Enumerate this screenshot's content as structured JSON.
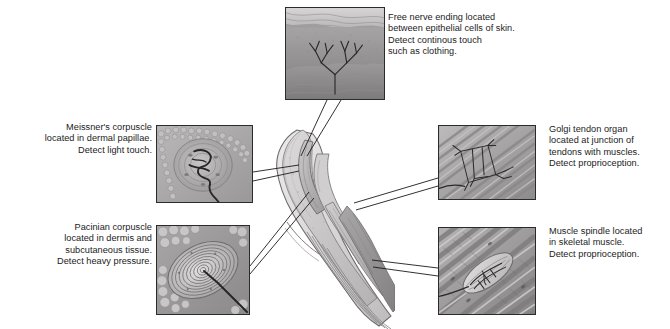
{
  "figure": {
    "background_color": "#ffffff",
    "text_color": "#1b1b1b",
    "panel_border_color": "#2b2b2b",
    "leader_line_color": "#1b1b1b"
  },
  "central_figure": {
    "name": "fingertip-cross-section",
    "description": "Sagittal section of a fingertip showing nail, epidermis, dermis, subcutaneous tissue, tendons and muscle"
  },
  "callouts": [
    {
      "id": "free-nerve-ending",
      "align": "left",
      "text": "Free nerve ending located\nbetween epithelial cells of skin.\nDetect continous touch\nsuch as clothing.",
      "label_x": 388,
      "label_y": 12,
      "panel": {
        "x": 285,
        "y": 7,
        "w": 100,
        "h": 93,
        "icon": "free-nerve-ending-micrograph"
      },
      "leader": {
        "from_x": 333,
        "from_y": 100,
        "to_x": 303,
        "to_y": 155,
        "spread": 7
      }
    },
    {
      "id": "meissners-corpuscle",
      "align": "right",
      "text": "Meissner's corpuscle\nlocated in dermal papillae.\nDetect light touch.",
      "label_x": 27,
      "label_y": 122,
      "label_w": 125,
      "panel": {
        "x": 156,
        "y": 125,
        "w": 97,
        "h": 78,
        "icon": "meissners-corpuscle-micrograph"
      },
      "leader": {
        "from_x": 253,
        "from_y": 176,
        "to_x": 300,
        "to_y": 168,
        "spread": 6
      }
    },
    {
      "id": "pacinian-corpuscle",
      "align": "right",
      "text": "Pacinian corpuscle\nlocated in dermis and\nsubcutaneous tissue.\nDetect heavy pressure.",
      "label_x": 17,
      "label_y": 222,
      "label_w": 135,
      "panel": {
        "x": 156,
        "y": 225,
        "w": 94,
        "h": 90,
        "icon": "pacinian-corpuscle-micrograph"
      },
      "leader": {
        "from_x": 250,
        "from_y": 272,
        "to_x": 310,
        "to_y": 196,
        "spread": 7
      }
    },
    {
      "id": "golgi-tendon-organ",
      "align": "left",
      "text": "Golgi tendon organ\nlocated at junction of\ntendons with muscles.\nDetect proprioception.",
      "label_x": 549,
      "label_y": 124,
      "panel": {
        "x": 438,
        "y": 125,
        "w": 98,
        "h": 75,
        "icon": "golgi-tendon-organ-micrograph"
      },
      "leader": {
        "from_x": 438,
        "from_y": 182,
        "to_x": 352,
        "to_y": 207,
        "spread": 6
      }
    },
    {
      "id": "muscle-spindle",
      "align": "left",
      "text": "Muscle spindle located\nin skeletal muscle.\nDetect proprioception.",
      "label_x": 549,
      "label_y": 226,
      "panel": {
        "x": 438,
        "y": 227,
        "w": 98,
        "h": 88,
        "icon": "muscle-spindle-micrograph"
      },
      "leader": {
        "from_x": 438,
        "from_y": 272,
        "to_x": 370,
        "to_y": 264,
        "spread": 6
      }
    }
  ]
}
